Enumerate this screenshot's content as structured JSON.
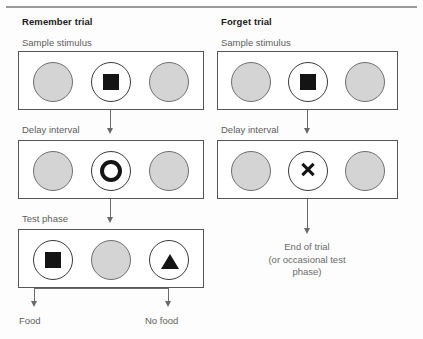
{
  "figure": {
    "caption_alt": "Remember versus forget trial procedure diagram"
  },
  "panels": [
    {
      "id": "remember",
      "title": "Remember trial",
      "stages": [
        {
          "id": "sample-stimulus",
          "label": "Sample stimulus",
          "keys": [
            {
              "fill": "gray",
              "symbol": "none"
            },
            {
              "fill": "white",
              "symbol": "square"
            },
            {
              "fill": "gray",
              "symbol": "none"
            }
          ]
        },
        {
          "id": "delay-interval",
          "label": "Delay interval",
          "keys": [
            {
              "fill": "gray",
              "symbol": "none"
            },
            {
              "fill": "white",
              "symbol": "ring"
            },
            {
              "fill": "gray",
              "symbol": "none"
            }
          ]
        },
        {
          "id": "test-phase",
          "label": "Test phase",
          "keys": [
            {
              "fill": "white",
              "symbol": "square"
            },
            {
              "fill": "gray",
              "symbol": "none"
            },
            {
              "fill": "white",
              "symbol": "triangle"
            }
          ]
        }
      ],
      "outcomes": [
        {
          "id": "food",
          "label": "Food"
        },
        {
          "id": "no-food",
          "label": "No food"
        }
      ]
    },
    {
      "id": "forget",
      "title": "Forget trial",
      "stages": [
        {
          "id": "sample-stimulus",
          "label": "Sample stimulus",
          "keys": [
            {
              "fill": "gray",
              "symbol": "none"
            },
            {
              "fill": "white",
              "symbol": "square"
            },
            {
              "fill": "gray",
              "symbol": "none"
            }
          ]
        },
        {
          "id": "delay-interval",
          "label": "Delay interval",
          "keys": [
            {
              "fill": "gray",
              "symbol": "none"
            },
            {
              "fill": "white",
              "symbol": "x"
            },
            {
              "fill": "gray",
              "symbol": "none"
            }
          ]
        }
      ],
      "end": {
        "line1": "End of trial",
        "line2": "(or occasional test",
        "line3": "phase)"
      }
    }
  ],
  "colors": {
    "key_gray_fill": "#d4d4d4",
    "key_outline": "#6f6f6f",
    "symbol_black": "#141414",
    "box_stroke": "#555555",
    "arrow": "#6a6a6a",
    "title_text": "#1b1b1b",
    "label_text": "#5d5d5d",
    "rule": "#9a9a9a",
    "background": "#fdfdfd"
  }
}
